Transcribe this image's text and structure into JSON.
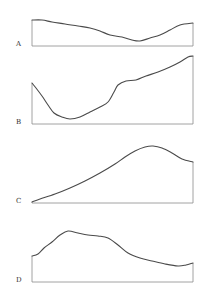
{
  "figure": {
    "panels": [
      {
        "label": "A",
        "baseline_y": 46,
        "x_start": 32,
        "x_end": 193,
        "points": [
          [
            32,
            20
          ],
          [
            42,
            20
          ],
          [
            52,
            22
          ],
          [
            65,
            24
          ],
          [
            78,
            26
          ],
          [
            90,
            28
          ],
          [
            100,
            31
          ],
          [
            110,
            35
          ],
          [
            122,
            37
          ],
          [
            132,
            40
          ],
          [
            140,
            41
          ],
          [
            150,
            38
          ],
          [
            160,
            35
          ],
          [
            170,
            30
          ],
          [
            180,
            25
          ],
          [
            193,
            23
          ]
        ]
      },
      {
        "label": "B",
        "baseline_y": 124,
        "x_start": 32,
        "x_end": 193,
        "points": [
          [
            32,
            83
          ],
          [
            36,
            88
          ],
          [
            42,
            96
          ],
          [
            48,
            105
          ],
          [
            54,
            113
          ],
          [
            62,
            117
          ],
          [
            70,
            119
          ],
          [
            80,
            117
          ],
          [
            90,
            112
          ],
          [
            100,
            107
          ],
          [
            108,
            102
          ],
          [
            114,
            92
          ],
          [
            118,
            85
          ],
          [
            126,
            81
          ],
          [
            136,
            80
          ],
          [
            146,
            76
          ],
          [
            158,
            72
          ],
          [
            170,
            67
          ],
          [
            180,
            62
          ],
          [
            188,
            57
          ],
          [
            193,
            56
          ]
        ]
      },
      {
        "label": "C",
        "baseline_y": 203,
        "x_start": 32,
        "x_end": 193,
        "points": [
          [
            32,
            202
          ],
          [
            40,
            199
          ],
          [
            55,
            194
          ],
          [
            70,
            188
          ],
          [
            85,
            181
          ],
          [
            100,
            173
          ],
          [
            115,
            164
          ],
          [
            125,
            157
          ],
          [
            135,
            151
          ],
          [
            145,
            147
          ],
          [
            153,
            146
          ],
          [
            162,
            148
          ],
          [
            172,
            153
          ],
          [
            182,
            159
          ],
          [
            193,
            162
          ]
        ]
      },
      {
        "label": "D",
        "baseline_y": 282,
        "x_start": 32,
        "x_end": 193,
        "points": [
          [
            32,
            256
          ],
          [
            38,
            254
          ],
          [
            44,
            248
          ],
          [
            52,
            242
          ],
          [
            60,
            235
          ],
          [
            68,
            231
          ],
          [
            78,
            233
          ],
          [
            88,
            235
          ],
          [
            98,
            236
          ],
          [
            108,
            238
          ],
          [
            118,
            245
          ],
          [
            128,
            253
          ],
          [
            140,
            258
          ],
          [
            152,
            261
          ],
          [
            165,
            264
          ],
          [
            178,
            266
          ],
          [
            186,
            265
          ],
          [
            193,
            263
          ]
        ]
      }
    ],
    "colors": {
      "curve": "#4a4a4a",
      "axis": "#8a8a8a",
      "label": "#333333",
      "background": "#ffffff"
    }
  }
}
